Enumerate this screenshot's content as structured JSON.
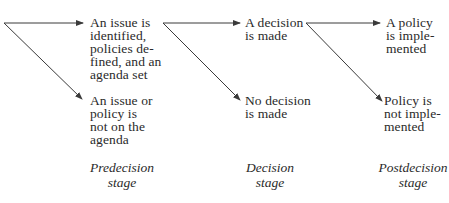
{
  "diagram": {
    "stages": [
      {
        "label_line1": "Predecision",
        "label_line2": "stage",
        "outcome_top": "An issue is\nidentified,\npolicies de-\nfined, and an\nagenda set",
        "outcome_bottom": "An issue or\npolicy is\nnot on the\nagenda"
      },
      {
        "label_line1": "Decision",
        "label_line2": "stage",
        "outcome_top": "A decision\nis made",
        "outcome_bottom": "No decision\nis made"
      },
      {
        "label_line1": "Postdecision",
        "label_line2": "stage",
        "outcome_top": "A policy\nis imple-\nmented",
        "outcome_bottom": "Policy is\nnot imple-\nmented"
      }
    ],
    "colors": {
      "line": "#3a3a3a",
      "text": "#2a2a2a",
      "background": "#ffffff"
    }
  }
}
